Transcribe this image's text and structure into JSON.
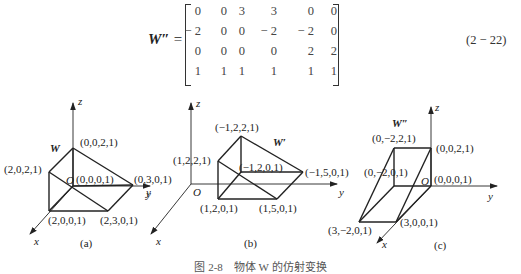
{
  "equation": {
    "lhs_symbol": "W″",
    "equals": "=",
    "number": "(2 − 22)",
    "matrix": [
      [
        "0",
        "0",
        "3",
        "3",
        "0",
        "0"
      ],
      [
        "− 2",
        "0",
        "0",
        "− 2",
        "− 2",
        "0"
      ],
      [
        "0",
        "0",
        "0",
        "0",
        "2",
        "2"
      ],
      [
        "1",
        "1",
        "1",
        "1",
        "1",
        "1"
      ]
    ]
  },
  "figures": {
    "a": {
      "label": "(a)",
      "object_label": "W",
      "axes": {
        "x": "x",
        "y": "y",
        "z": "z",
        "origin": "O"
      },
      "points": {
        "top": "(0,0,2,1)",
        "front_top": "(2,0,2,1)",
        "origin": "(0,0,0,1)",
        "y_end": "(0,3,0,1)",
        "front_bottom": "(2,0,0,1)",
        "front_right": "(2,3,0,1)"
      }
    },
    "b": {
      "label": "(b)",
      "object_label": "W′",
      "axes": {
        "x": "x",
        "y": "y",
        "z": "z",
        "origin": "O"
      },
      "points": {
        "back_top": "(−1,2,2,1)",
        "front_top": "(1,2,2,1)",
        "back_bottom": "(−1,2,0,1)",
        "back_right": "(−1,5,0,1)",
        "front_bottom": "(1,2,0,1)",
        "front_right": "(1,5,0,1)"
      }
    },
    "c": {
      "label": "(c)",
      "object_label": "W″",
      "axes": {
        "x": "x",
        "y": "y",
        "z": "z",
        "origin": "O"
      },
      "points": {
        "top_left": "(0,−2,2,1)",
        "top_right": "(0,0,2,1)",
        "back_bottom_left": "(0,−2,0,1)",
        "origin": "(0,0,0,1)",
        "front_left": "(3,−2,0,1)",
        "front_right": "(3,0,0,1)"
      }
    }
  },
  "caption": "图 2-8　物体 W 的仿射变换"
}
